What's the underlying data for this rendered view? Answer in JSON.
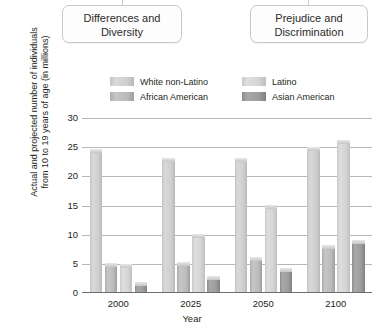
{
  "callouts": [
    {
      "name": "differences-and-diversity",
      "text": "Differences and Diversity"
    },
    {
      "name": "prejudice-and-discrimination",
      "text": "Prejudice and Discrimination"
    }
  ],
  "chart_data": {
    "type": "bar",
    "title": "",
    "xlabel": "Year",
    "ylabel": "Actual and projected number of individuals from 10 to 19 years of age (in millions)",
    "categories": [
      "2000",
      "2025",
      "2050",
      "2100"
    ],
    "series": [
      {
        "name": "White non-Latino",
        "color": "#d0d0d0",
        "values": [
          24.5,
          23.0,
          23.0,
          24.8
        ]
      },
      {
        "name": "African American",
        "color": "#bbbbbb",
        "values": [
          5.0,
          5.2,
          6.0,
          8.0
        ]
      },
      {
        "name": "Latino",
        "color": "#d8d8d8",
        "values": [
          4.8,
          10.0,
          15.0,
          26.0
        ]
      },
      {
        "name": "Asian American",
        "color": "#9a9a9a",
        "values": [
          1.8,
          2.7,
          4.2,
          9.0
        ]
      }
    ],
    "ylim": [
      0,
      30
    ],
    "yticks": [
      "0",
      "5",
      "10",
      "15",
      "20",
      "25",
      "30"
    ],
    "grid": true,
    "legend_position": "top"
  }
}
